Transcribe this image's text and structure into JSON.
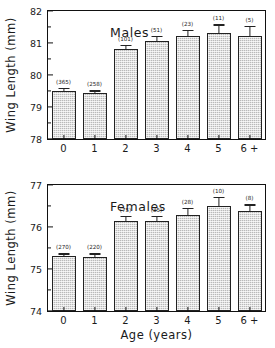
{
  "figure": {
    "background": "#ffffff",
    "bar_fill": "#b9b9b9",
    "line_color": "#111111"
  },
  "chart_data": [
    {
      "type": "bar",
      "title": "Males",
      "xlabel": "",
      "ylabel": "Wing Length (mm)",
      "categories": [
        "0",
        "1",
        "2",
        "3",
        "4",
        "5",
        "6 +"
      ],
      "values": [
        79.5,
        79.45,
        80.8,
        81.05,
        81.22,
        81.3,
        81.22
      ],
      "errors": [
        0.09,
        0.07,
        0.13,
        0.16,
        0.2,
        0.28,
        0.32
      ],
      "annotations": [
        "(365)",
        "(258)",
        "(101)",
        "(51)",
        "(23)",
        "(11)",
        "(5)"
      ],
      "ylim": [
        78,
        82
      ],
      "yticks": [
        "78",
        "79",
        "80",
        "81",
        "82"
      ],
      "grid": false,
      "legend": "none"
    },
    {
      "type": "bar",
      "title": "Females",
      "xlabel": "Age (years)",
      "ylabel": "Wing Length (mm)",
      "categories": [
        "0",
        "1",
        "2",
        "3",
        "4",
        "5",
        "6 +"
      ],
      "values": [
        75.3,
        75.28,
        76.15,
        76.15,
        76.28,
        76.5,
        76.38
      ],
      "errors": [
        0.07,
        0.09,
        0.12,
        0.12,
        0.18,
        0.22,
        0.16
      ],
      "annotations": [
        "(270)",
        "(220)",
        "(75)",
        "(35)",
        "(28)",
        "(10)",
        "(8)"
      ],
      "ylim": [
        74,
        77
      ],
      "yticks": [
        "74",
        "75",
        "76",
        "77"
      ],
      "grid": false,
      "legend": "none"
    }
  ]
}
